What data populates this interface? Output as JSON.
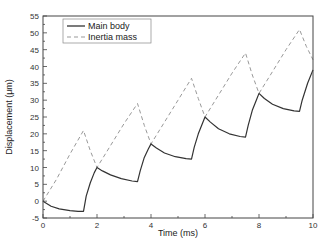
{
  "chart_data": {
    "type": "line",
    "title": "",
    "xlabel": "Time (ms)",
    "ylabel": "Displacement (μm)",
    "xlim": [
      0,
      10
    ],
    "ylim": [
      -5,
      55
    ],
    "xticks": [
      0,
      2,
      4,
      6,
      8,
      10
    ],
    "yticks": [
      -5,
      0,
      5,
      10,
      15,
      20,
      25,
      30,
      35,
      40,
      45,
      50,
      55
    ],
    "grid": false,
    "legend_position": "upper left",
    "series": [
      {
        "name": "Main body",
        "style": "solid",
        "color": "#333333",
        "x": [
          0,
          0.3,
          0.6,
          1.0,
          1.3,
          1.5,
          1.6,
          1.75,
          1.9,
          2.0,
          2.2,
          2.5,
          2.9,
          3.3,
          3.5,
          3.6,
          3.75,
          3.9,
          4.0,
          4.2,
          4.5,
          4.9,
          5.3,
          5.5,
          5.6,
          5.75,
          5.9,
          6.0,
          6.2,
          6.5,
          6.9,
          7.3,
          7.5,
          7.6,
          7.75,
          7.9,
          8.0,
          8.2,
          8.5,
          8.9,
          9.3,
          9.5,
          9.6,
          9.8,
          10.0
        ],
        "y": [
          0,
          -1.5,
          -2.3,
          -2.8,
          -3.0,
          -3.0,
          1.5,
          5.5,
          8.5,
          10.0,
          9.0,
          7.8,
          6.7,
          6.0,
          5.8,
          9.0,
          13.0,
          15.5,
          17.0,
          15.8,
          14.3,
          13.2,
          12.6,
          12.5,
          16.0,
          20.0,
          23.0,
          25.0,
          23.5,
          21.5,
          20.0,
          19.2,
          19.0,
          22.5,
          27.0,
          30.0,
          32.0,
          30.5,
          28.8,
          27.5,
          26.8,
          26.7,
          30.0,
          35.0,
          39.0
        ]
      },
      {
        "name": "Inertia mass",
        "style": "dashed",
        "color": "#999999",
        "x": [
          0,
          0.5,
          1.0,
          1.5,
          1.75,
          2.0,
          2.5,
          3.0,
          3.5,
          3.75,
          4.0,
          4.5,
          5.0,
          5.5,
          5.75,
          6.0,
          6.5,
          7.0,
          7.5,
          7.75,
          8.0,
          8.5,
          9.0,
          9.5,
          9.75,
          10.0
        ],
        "y": [
          0,
          6.5,
          14.0,
          21.0,
          15.0,
          10.0,
          16.5,
          23.0,
          29.0,
          22.5,
          17.0,
          23.5,
          30.0,
          36.5,
          30.5,
          25.0,
          31.5,
          38.0,
          44.0,
          37.5,
          32.0,
          38.5,
          45.0,
          51.0,
          46.0,
          42.0
        ]
      }
    ]
  },
  "legend": {
    "items": [
      {
        "label": "Main body",
        "style": "solid"
      },
      {
        "label": "Inertia mass",
        "style": "dashed"
      }
    ]
  },
  "axes": {
    "xlabel": "Time (ms)",
    "ylabel": "Displacement (μm)"
  }
}
